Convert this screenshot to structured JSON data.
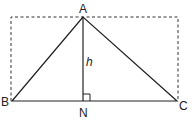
{
  "diagram": {
    "points": {
      "A": {
        "label": "A",
        "x": 83,
        "y": 17
      },
      "B": {
        "label": "B",
        "x": 12,
        "y": 101
      },
      "C": {
        "label": "C",
        "x": 177,
        "y": 101
      },
      "N": {
        "label": "N",
        "x": 83,
        "y": 101
      }
    },
    "altitude_label": "h",
    "right_angle_marker": "N",
    "dashed_rectangle": {
      "x1": 11,
      "y1": 17,
      "x2": 178,
      "y2": 101
    },
    "colors": {
      "line": "#222222",
      "dashed": "#333333"
    }
  }
}
